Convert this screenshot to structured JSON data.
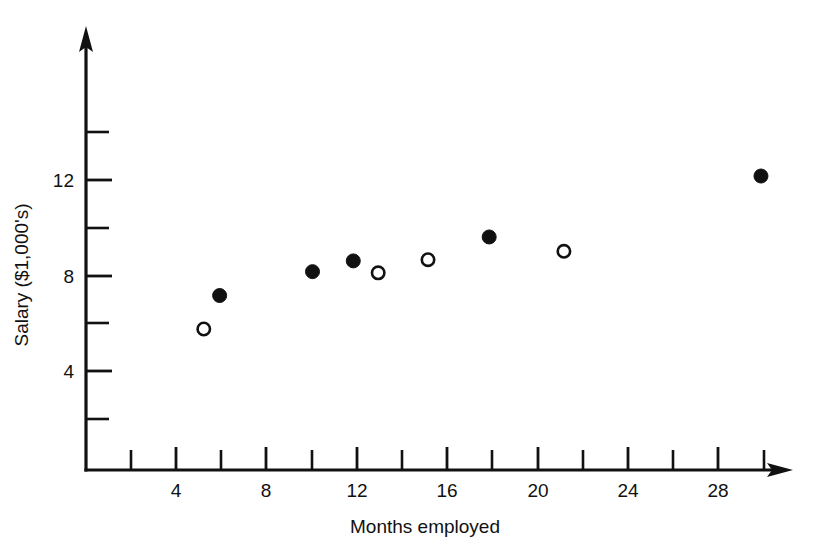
{
  "chart_data": {
    "type": "scatter",
    "title": "",
    "xlabel": "Months employed",
    "ylabel": "Salary ($1,000's)",
    "xlim": [
      0,
      32
    ],
    "ylim": [
      0,
      15
    ],
    "grid": false,
    "legend": "none",
    "x_ticks_labeled": [
      4,
      8,
      12,
      16,
      20,
      24,
      28
    ],
    "x_ticks_unlabeled": [
      2,
      6,
      10,
      14,
      18,
      22,
      26,
      30
    ],
    "y_ticks_labeled": [
      4,
      8,
      12
    ],
    "y_ticks_unlabeled": [
      2,
      6,
      10,
      14
    ],
    "x_tick_label_text": [
      "4",
      "8",
      "12",
      "16",
      "20",
      "24",
      "28"
    ],
    "y_tick_label_text": [
      "4",
      "8",
      "12"
    ],
    "series": [
      {
        "name": "filled-markers",
        "marker": "filled-circle",
        "points": [
          {
            "x": 5.9,
            "y": 7.3
          },
          {
            "x": 10.0,
            "y": 8.3
          },
          {
            "x": 11.8,
            "y": 8.75
          },
          {
            "x": 17.8,
            "y": 9.75
          },
          {
            "x": 29.8,
            "y": 12.3
          }
        ]
      },
      {
        "name": "open-markers",
        "marker": "open-circle",
        "points": [
          {
            "x": 5.2,
            "y": 5.9
          },
          {
            "x": 12.9,
            "y": 8.25
          },
          {
            "x": 15.1,
            "y": 8.8
          },
          {
            "x": 21.1,
            "y": 9.15
          }
        ]
      }
    ]
  },
  "figure": {
    "axis_color": "#111111",
    "background_color": "#ffffff",
    "marker_fill_color": "#111111",
    "marker_open_color": "#ffffff"
  }
}
